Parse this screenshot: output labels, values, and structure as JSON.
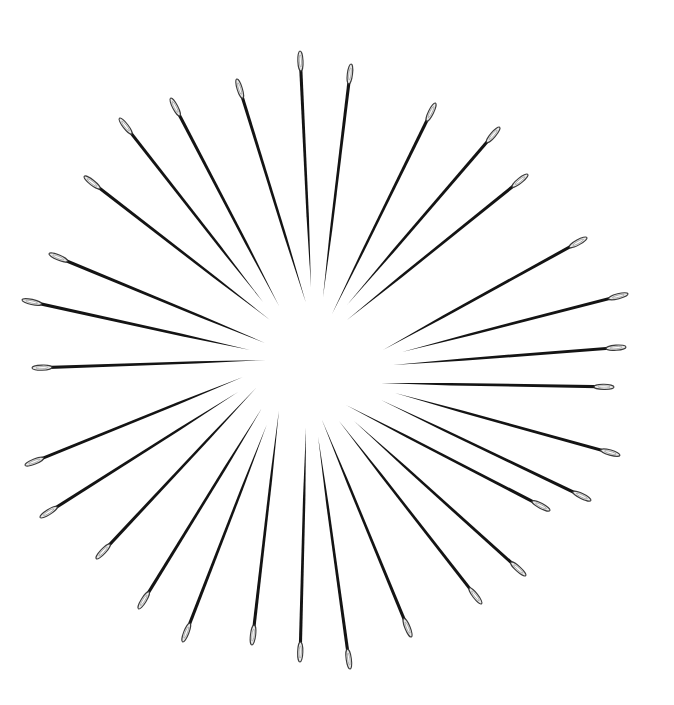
{
  "image": {
    "description": "Sewing needles arranged radially in a sunburst pattern on a white background",
    "background": "#ffffff",
    "needle_color": "#141414",
    "needle_count": 30
  },
  "needles": [
    {
      "eye": [
        300,
        52
      ],
      "point": [
        311,
        287
      ]
    },
    {
      "eye": [
        351,
        65
      ],
      "point": [
        323,
        297
      ]
    },
    {
      "eye": [
        237,
        80
      ],
      "point": [
        306,
        303
      ]
    },
    {
      "eye": [
        171,
        99
      ],
      "point": [
        279,
        306
      ]
    },
    {
      "eye": [
        120,
        119
      ],
      "point": [
        263,
        302
      ]
    },
    {
      "eye": [
        435,
        104
      ],
      "point": [
        332,
        314
      ]
    },
    {
      "eye": [
        499,
        128
      ],
      "point": [
        347,
        305
      ]
    },
    {
      "eye": [
        527,
        175
      ],
      "point": [
        347,
        320
      ]
    },
    {
      "eye": [
        85,
        177
      ],
      "point": [
        270,
        320
      ]
    },
    {
      "eye": [
        50,
        254
      ],
      "point": [
        265,
        343
      ]
    },
    {
      "eye": [
        586,
        238
      ],
      "point": [
        383,
        350
      ]
    },
    {
      "eye": [
        23,
        300
      ],
      "point": [
        250,
        350
      ]
    },
    {
      "eye": [
        627,
        294
      ],
      "point": [
        402,
        352
      ]
    },
    {
      "eye": [
        625,
        347
      ],
      "point": [
        393,
        365
      ]
    },
    {
      "eye": [
        33,
        368
      ],
      "point": [
        266,
        360
      ]
    },
    {
      "eye": [
        613,
        387
      ],
      "point": [
        381,
        383
      ]
    },
    {
      "eye": [
        26,
        465
      ],
      "point": [
        243,
        377
      ]
    },
    {
      "eye": [
        619,
        455
      ],
      "point": [
        395,
        393
      ]
    },
    {
      "eye": [
        41,
        517
      ],
      "point": [
        238,
        392
      ]
    },
    {
      "eye": [
        97,
        558
      ],
      "point": [
        256,
        388
      ]
    },
    {
      "eye": [
        590,
        500
      ],
      "point": [
        381,
        400
      ]
    },
    {
      "eye": [
        549,
        510
      ],
      "point": [
        346,
        405
      ]
    },
    {
      "eye": [
        139,
        608
      ],
      "point": [
        262,
        408
      ]
    },
    {
      "eye": [
        252,
        644
      ],
      "point": [
        279,
        410
      ]
    },
    {
      "eye": [
        525,
        575
      ],
      "point": [
        354,
        421
      ]
    },
    {
      "eye": [
        481,
        603
      ],
      "point": [
        339,
        421
      ]
    },
    {
      "eye": [
        411,
        636
      ],
      "point": [
        322,
        420
      ]
    },
    {
      "eye": [
        183,
        641
      ],
      "point": [
        267,
        424
      ]
    },
    {
      "eye": [
        300,
        661
      ],
      "point": [
        306,
        428
      ]
    },
    {
      "eye": [
        350,
        668
      ],
      "point": [
        318,
        436
      ]
    }
  ]
}
